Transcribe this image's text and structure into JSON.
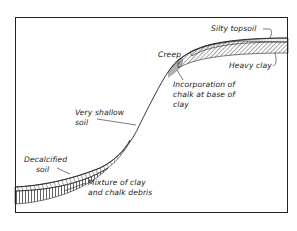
{
  "figure": {
    "type": "soil-profile-cross-section",
    "labels": {
      "silty_topsoil": "Silty topsoil",
      "heavy_clay": "Heavy clay",
      "creep": "Creep",
      "incorporation_line1": "Incorporation of",
      "incorporation_line2": "chalk at base of",
      "incorporation_line3": "clay",
      "very_shallow_line1": "Very shallow",
      "very_shallow_line2": "soil",
      "decalcified_line1": "Decalcified",
      "decalcified_line2": "soil",
      "mixture_line1": "Mixture of clay",
      "mixture_line2": "and chalk debris"
    },
    "colors": {
      "ink": "#222222",
      "background": "#ffffff"
    }
  }
}
